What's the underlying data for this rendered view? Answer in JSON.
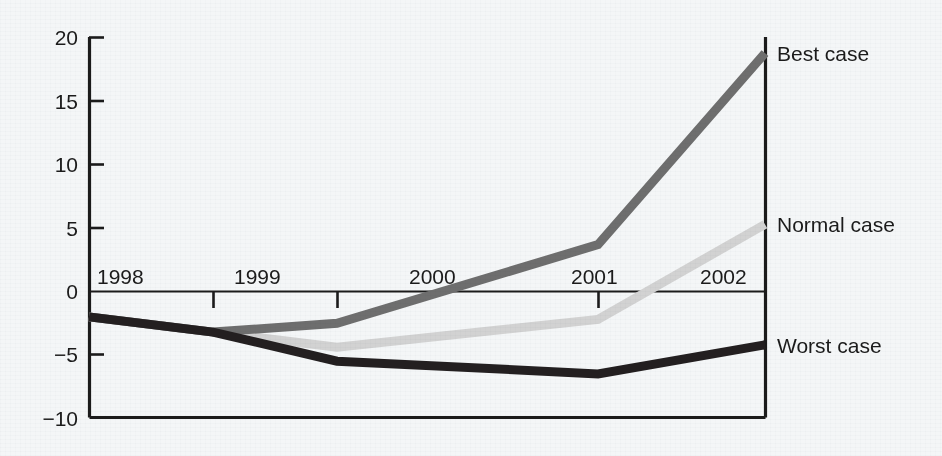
{
  "chart_data": {
    "type": "line",
    "title": "",
    "subtitle": "",
    "xlabel": "",
    "ylabel": "",
    "categories": [
      "1998",
      "1999",
      "2000",
      "2001",
      "2002"
    ],
    "x": [
      1998,
      1999,
      2000,
      2001,
      2002
    ],
    "ylim": [
      -10,
      20
    ],
    "xlim": [
      1998,
      2002
    ],
    "yticks": [
      "20",
      "15",
      "10",
      "5",
      "0",
      "−5",
      "−10"
    ],
    "ytick_values": [
      20,
      15,
      10,
      5,
      0,
      -5,
      -10
    ],
    "xticks": [
      "1998",
      "1999",
      "2000",
      "2001",
      "2002"
    ],
    "grid": false,
    "legend_position": "right-of-axes-inline",
    "zero_line": true,
    "series": [
      {
        "name": "Best case",
        "color": "#6e6e6e",
        "values": [
          -2.0,
          -3.2,
          -2.5,
          3.7,
          18.8
        ]
      },
      {
        "name": "Normal case",
        "color": "#d2d2d2",
        "values": [
          -2.0,
          -3.2,
          -4.4,
          -2.2,
          5.3
        ]
      },
      {
        "name": "Worst case",
        "color": "#231f20",
        "values": [
          -2.0,
          -3.2,
          -5.5,
          -6.5,
          -4.2
        ]
      }
    ],
    "annotations": [
      {
        "text": "Best case",
        "series": "Best case",
        "anchor": "end-of-line"
      },
      {
        "text": "Normal case",
        "series": "Normal case",
        "anchor": "end-of-line"
      },
      {
        "text": "Worst case",
        "series": "Worst case",
        "anchor": "end-of-line"
      }
    ]
  },
  "colors": {
    "background": "#f4f6f7",
    "axis": "#1b1b1b",
    "text": "#1b1b1b",
    "best_case": "#6e6e6e",
    "normal_case": "#d2d2d2",
    "worst_case": "#231f20"
  }
}
